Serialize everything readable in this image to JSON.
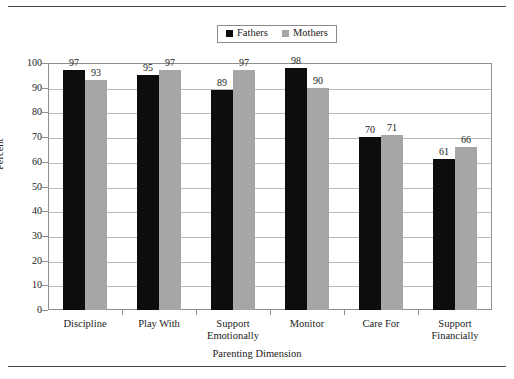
{
  "figure": {
    "top_rule": true,
    "bottom_rule": true,
    "clipped_header_text": ""
  },
  "legend": {
    "position": "top-center",
    "entries": [
      {
        "label": "Fathers",
        "color": "#0d0d0d"
      },
      {
        "label": "Mothers",
        "color": "#a6a6a6"
      }
    ]
  },
  "axes": {
    "ylabel": "Percent",
    "xlabel": "Parenting Dimension",
    "yticks": [
      "0",
      "10",
      "20",
      "30",
      "40",
      "50",
      "60",
      "70",
      "80",
      "90",
      "100"
    ]
  },
  "chart_data": {
    "type": "bar",
    "title": "",
    "xlabel": "Parenting Dimension",
    "ylabel": "Percent",
    "ylim": [
      0,
      100
    ],
    "ytick_step": 10,
    "grid": true,
    "grid_axis": "y",
    "legend_position": "top-center",
    "categories": [
      "Discipline",
      "Play With",
      "Support Emotionally",
      "Monitor",
      "Care For",
      "Support Financially"
    ],
    "category_lines": [
      [
        "Discipline",
        ""
      ],
      [
        "Play With",
        ""
      ],
      [
        "Support",
        "Emotionally"
      ],
      [
        "Monitor",
        ""
      ],
      [
        "Care For",
        ""
      ],
      [
        "Support",
        "Financially"
      ]
    ],
    "series": [
      {
        "name": "Fathers",
        "color": "#0d0d0d",
        "values": [
          97,
          95,
          89,
          98,
          70,
          61
        ]
      },
      {
        "name": "Mothers",
        "color": "#a6a6a6",
        "values": [
          93,
          97,
          97,
          90,
          71,
          66
        ]
      }
    ]
  }
}
